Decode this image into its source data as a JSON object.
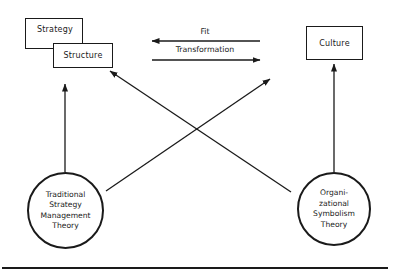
{
  "diagram": {
    "boxes": {
      "strategy": "Strategy",
      "structure": "Structure",
      "culture": "Culture"
    },
    "relations": {
      "fit": "Fit",
      "transformation": "Transformation"
    },
    "theories": {
      "traditional": [
        "Traditional",
        "Strategy",
        "Management",
        "Theory"
      ],
      "symbolism": [
        "Organi-",
        "zational",
        "Symbolism",
        "Theory"
      ]
    },
    "colors": {
      "ink": "#1a1a1a",
      "background": "#ffffff"
    }
  }
}
